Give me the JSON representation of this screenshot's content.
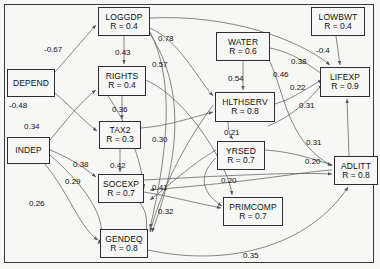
{
  "figure": {
    "kind": "path-diagram",
    "background_color": "#f7f7f5",
    "border_color": "#3a3a3a",
    "node_fill": "#f7f7f5",
    "node_stroke": "#2e2e2e",
    "edge_color": "#555555"
  },
  "nodes": [
    {
      "id": "loggdp",
      "name": "LOGGDP",
      "r": "R = 0.4",
      "x": 98,
      "y": 7,
      "w": 52,
      "h": 29
    },
    {
      "id": "lowbwt",
      "name": "LOWBWT",
      "r": "R = 0.4",
      "x": 311,
      "y": 7,
      "w": 54,
      "h": 29
    },
    {
      "id": "water",
      "name": "WATER",
      "r": "R = 0.6",
      "x": 216,
      "y": 32,
      "w": 54,
      "h": 29
    },
    {
      "id": "rights",
      "name": "RIGHTS",
      "r": "R = 0.4",
      "x": 98,
      "y": 66,
      "w": 48,
      "h": 30
    },
    {
      "id": "lifexp",
      "name": "LIFEXP",
      "r": "R = 0.9",
      "x": 320,
      "y": 67,
      "w": 50,
      "h": 30
    },
    {
      "id": "hlthserv",
      "name": "HLTHSERV",
      "r": "R = 0.8",
      "x": 215,
      "y": 92,
      "w": 60,
      "h": 30
    },
    {
      "id": "tax2",
      "name": "TAX2",
      "r": "R = 0.3",
      "x": 99,
      "y": 121,
      "w": 42,
      "h": 28
    },
    {
      "id": "yrsed",
      "name": "YRSED",
      "r": "R = 0.7",
      "x": 217,
      "y": 141,
      "w": 48,
      "h": 29
    },
    {
      "id": "adlitt",
      "name": "ADLITT",
      "r": "R = 0.8",
      "x": 334,
      "y": 156,
      "w": 44,
      "h": 29
    },
    {
      "id": "socexp",
      "name": "SOCEXP",
      "r": "R = 0.7",
      "x": 98,
      "y": 174,
      "w": 46,
      "h": 29
    },
    {
      "id": "primcomp",
      "name": "PRIMCOMP",
      "r": "R = 0.7",
      "x": 223,
      "y": 197,
      "w": 60,
      "h": 29
    },
    {
      "id": "gendeq",
      "name": "GENDEQ",
      "r": "R = 0.8",
      "x": 100,
      "y": 229,
      "w": 48,
      "h": 29
    },
    {
      "id": "depend",
      "name": "DEPEND",
      "r": "",
      "x": 7,
      "y": 69,
      "w": 48,
      "h": 28
    },
    {
      "id": "indep",
      "name": "INDEP",
      "r": "",
      "x": 7,
      "y": 137,
      "w": 43,
      "h": 27
    }
  ],
  "edge_labels": [
    {
      "id": "e_depend_loggdp",
      "text": "-0.67",
      "x": 44,
      "y": 45
    },
    {
      "id": "e_loggdp_rights",
      "text": "0.43",
      "x": 115,
      "y": 48
    },
    {
      "id": "e_loggdp_right_a",
      "text": "0.78",
      "x": 158,
      "y": 34
    },
    {
      "id": "e_loggdp_right_b",
      "text": "0.57",
      "x": 152,
      "y": 60
    },
    {
      "id": "e_water_hlthserv",
      "text": "0.54",
      "x": 228,
      "y": 74
    },
    {
      "id": "e_water_curve",
      "text": "0.46",
      "x": 273,
      "y": 70
    },
    {
      "id": "e_water_lifexp",
      "text": "0.38",
      "x": 291,
      "y": 57
    },
    {
      "id": "e_lowbwt_lifexp",
      "text": "-0.4",
      "x": 316,
      "y": 46
    },
    {
      "id": "e_hlth_lifexp",
      "text": "0.22",
      "x": 290,
      "y": 83
    },
    {
      "id": "e_lifexp_down",
      "text": "0.31",
      "x": 299,
      "y": 101
    },
    {
      "id": "e_depend_down",
      "text": "-0.48",
      "x": 9,
      "y": 101
    },
    {
      "id": "e_rights_tax2",
      "text": "0.36",
      "x": 112,
      "y": 105
    },
    {
      "id": "e_indep_up",
      "text": "0.34",
      "x": 24,
      "y": 122
    },
    {
      "id": "e_tax2_right",
      "text": "0.30",
      "x": 152,
      "y": 135
    },
    {
      "id": "e_hlth_down",
      "text": "0.21",
      "x": 224,
      "y": 128
    },
    {
      "id": "e_adlitt_up",
      "text": "0.31",
      "x": 306,
      "y": 138
    },
    {
      "id": "e_yrsed_adlitt",
      "text": "0.20",
      "x": 305,
      "y": 157
    },
    {
      "id": "e_tax2_socexp",
      "text": "0.42",
      "x": 110,
      "y": 161
    },
    {
      "id": "e_indep_diag",
      "text": "0.38",
      "x": 73,
      "y": 160
    },
    {
      "id": "e_indep_curve",
      "text": "0.29",
      "x": 65,
      "y": 177
    },
    {
      "id": "e_socexp_right",
      "text": "0.41",
      "x": 152,
      "y": 183
    },
    {
      "id": "e_yrsed_left",
      "text": "0.20",
      "x": 221,
      "y": 176
    },
    {
      "id": "e_socexp_gendeq",
      "text": "0.32",
      "x": 158,
      "y": 207
    },
    {
      "id": "e_indep_gendeq",
      "text": "0.26",
      "x": 29,
      "y": 199
    },
    {
      "id": "e_gendeq_adlitt",
      "text": "0.35",
      "x": 243,
      "y": 251
    }
  ],
  "edges": [
    {
      "from": "depend",
      "to": "loggdp",
      "label": "-0.67"
    },
    {
      "from": "loggdp",
      "to": "rights",
      "label": "0.43"
    },
    {
      "from": "loggdp",
      "to": "lifexp",
      "label": "0.78"
    },
    {
      "from": "loggdp",
      "to": "hlthserv",
      "label": "0.57"
    },
    {
      "from": "water",
      "to": "hlthserv",
      "label": "0.54"
    },
    {
      "from": "water",
      "to": "lifexp",
      "label": "0.38"
    },
    {
      "from": "water",
      "to": "adlitt",
      "label": "0.46"
    },
    {
      "from": "lowbwt",
      "to": "lifexp",
      "label": "-0.4"
    },
    {
      "from": "hlthserv",
      "to": "lifexp",
      "label": "0.22"
    },
    {
      "from": "adlitt",
      "to": "lifexp",
      "label": "0.31"
    },
    {
      "from": "adlitt",
      "to": "lifexp",
      "label": "0.20"
    },
    {
      "from": "depend",
      "to": "tax2",
      "label": "-0.48"
    },
    {
      "from": "rights",
      "to": "tax2",
      "label": "0.36"
    },
    {
      "from": "indep",
      "to": "rights",
      "label": "0.34"
    },
    {
      "from": "tax2",
      "to": "hlthserv",
      "label": "0.30"
    },
    {
      "from": "hlthserv",
      "to": "yrsed",
      "label": "0.21"
    },
    {
      "from": "yrsed",
      "to": "adlitt",
      "label": "0.31"
    },
    {
      "from": "yrsed",
      "to": "adlitt",
      "label": "0.20"
    },
    {
      "from": "tax2",
      "to": "socexp",
      "label": "0.42"
    },
    {
      "from": "indep",
      "to": "socexp",
      "label": "0.38"
    },
    {
      "from": "indep",
      "to": "gendeq",
      "label": "0.29"
    },
    {
      "from": "socexp",
      "to": "primcomp",
      "label": "0.41"
    },
    {
      "from": "socexp",
      "to": "gendeq",
      "label": "0.32"
    },
    {
      "from": "indep",
      "to": "gendeq",
      "label": "0.26"
    },
    {
      "from": "gendeq",
      "to": "adlitt",
      "label": "0.35"
    }
  ]
}
